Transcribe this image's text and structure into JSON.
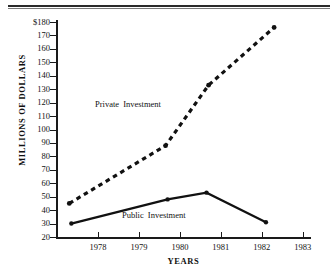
{
  "page": {
    "top_rule": "horizontal-rule"
  },
  "chart_data": {
    "type": "line",
    "title": "",
    "xlabel": "YEARS",
    "ylabel": "MILLIONS OF DOLLARS",
    "xlim": [
      1977,
      1983.2
    ],
    "ylim": [
      20,
      180
    ],
    "grid": false,
    "legend": "inline-annotations",
    "y_ticks": [
      180,
      170,
      160,
      150,
      140,
      130,
      120,
      110,
      100,
      90,
      80,
      70,
      60,
      50,
      40,
      30,
      20
    ],
    "y_tick_labels": [
      "$180",
      "170",
      "160",
      "150",
      "140",
      "130",
      "120",
      "110",
      "100",
      "90",
      "80",
      "70",
      "60",
      "50",
      "40",
      "30",
      "20"
    ],
    "x_ticks": [
      1978,
      1979,
      1980,
      1981,
      1982,
      1983
    ],
    "x_tick_labels": [
      "1978",
      "1979",
      "1980",
      "1981",
      "1982",
      "1983"
    ],
    "series": [
      {
        "name": "Private Investment",
        "style": "dashed",
        "color": "#111111",
        "x": [
          1977.3,
          1979.65,
          1980.7,
          1982.3
        ],
        "values": [
          45,
          88,
          133,
          176
        ]
      },
      {
        "name": "Public Investment",
        "style": "solid",
        "color": "#111111",
        "x": [
          1977.35,
          1979.7,
          1980.65,
          1982.1
        ],
        "values": [
          30,
          48,
          53,
          31
        ]
      }
    ],
    "annotations": [
      {
        "text": "Private Investment",
        "x": 1978.0,
        "y": 113
      },
      {
        "text": "Public Investment",
        "x": 1978.7,
        "y": 42
      }
    ]
  }
}
